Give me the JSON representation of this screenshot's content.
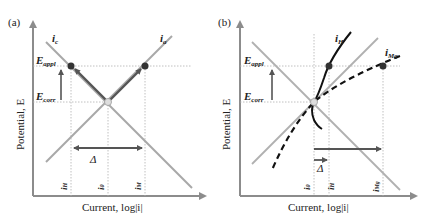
{
  "panels": [
    {
      "id": "a",
      "label": "(a)",
      "curves": {
        "cathodic": "i",
        "cathodic_sub": "c",
        "anodic": "i",
        "anodic_sub": "a"
      },
      "potentials": {
        "applied": "E",
        "applied_sub": "appl",
        "corrosion": "E",
        "corrosion_sub": "corr"
      },
      "delta": "Δ",
      "currents": [
        {
          "main": "i",
          "sub": "H"
        },
        {
          "main": "i",
          "sub": "0"
        },
        {
          "main": "i",
          "sub": "M"
        }
      ],
      "y_axis_title": "Potential, E",
      "x_axis_title": "Current, log|i|"
    },
    {
      "id": "b",
      "label": "(b)",
      "curves": {
        "hydrogen": "i",
        "hydrogen_sub": "H",
        "magnesium": "i",
        "magnesium_sub": "Mg"
      },
      "potentials": {
        "applied": "E",
        "applied_sub": "appl",
        "corrosion": "E",
        "corrosion_sub": "corr"
      },
      "delta": "Δ",
      "currents": [
        {
          "main": "i",
          "sub": "0"
        },
        {
          "main": "i",
          "sub": "H"
        },
        {
          "main": "i",
          "sub": "Mg"
        }
      ],
      "y_axis_title": "Potential, E",
      "x_axis_title": "Current, log|i|"
    }
  ],
  "colors": {
    "axis": "#8c8c8c",
    "line_gray": "#a8a8a8",
    "line_dark": "#111111",
    "arrow": "#555555",
    "guide": "#b0b0b0",
    "point": "#333333"
  }
}
